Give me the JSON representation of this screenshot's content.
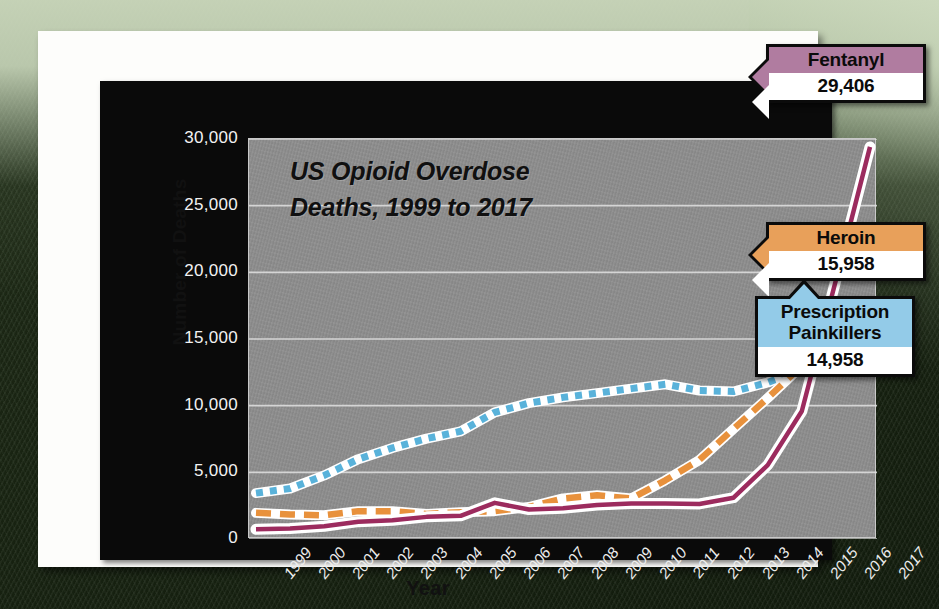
{
  "chart_data": {
    "type": "line",
    "title": "US Opioid Overdose Deaths, 1999 to 2017",
    "title_line1": "US Opioid Overdose",
    "title_line2": "Deaths, 1999 to 2017",
    "xlabel": "Year",
    "ylabel": "Number of Deaths",
    "ylim": [
      0,
      30000
    ],
    "ytick_labels": [
      "30,000",
      "25,000",
      "20,000",
      "15,000",
      "10,000",
      "5,000",
      "0"
    ],
    "ytick_values": [
      30000,
      25000,
      20000,
      15000,
      10000,
      5000,
      0
    ],
    "grid": true,
    "legend_position": "callout-labels-right",
    "categories": [
      "1999",
      "2000",
      "2001",
      "2002",
      "2003",
      "2004",
      "2005",
      "2006",
      "2007",
      "2008",
      "2009",
      "2010",
      "2011",
      "2012",
      "2013",
      "2014",
      "2015",
      "2016",
      "2017"
    ],
    "series": [
      {
        "name": "Prescription Painkillers",
        "style": "dotted",
        "color": "#59b2da",
        "end_value": 14958,
        "values": [
          3442,
          3785,
          4770,
          5990,
          6830,
          7530,
          8080,
          9500,
          10190,
          10620,
          10940,
          11280,
          11600,
          11140,
          11060,
          11740,
          12730,
          14480,
          14958
        ]
      },
      {
        "name": "Heroin",
        "style": "dashed",
        "color": "#e8913c",
        "end_value": 15958,
        "values": [
          1960,
          1840,
          1780,
          2090,
          2080,
          1880,
          2010,
          2090,
          2400,
          3040,
          3280,
          3036,
          4400,
          5930,
          8260,
          10570,
          12990,
          15470,
          15958
        ]
      },
      {
        "name": "Fentanyl",
        "style": "solid",
        "color": "#9c2b5e",
        "end_value": 29406,
        "values": [
          730,
          780,
          960,
          1300,
          1400,
          1660,
          1740,
          2710,
          2210,
          2310,
          2550,
          2670,
          2670,
          2630,
          3100,
          5540,
          9580,
          19410,
          29406
        ]
      }
    ]
  },
  "callouts": [
    {
      "id": "fentanyl",
      "title": "Fentanyl",
      "value": "29,406",
      "color": "#b07ca0"
    },
    {
      "id": "heroin",
      "title": "Heroin",
      "value": "15,958",
      "color": "#e8a05a"
    },
    {
      "id": "rx",
      "title_line1": "Prescription",
      "title_line2": "Painkillers",
      "value": "14,958",
      "color": "#93cbe8"
    }
  ]
}
